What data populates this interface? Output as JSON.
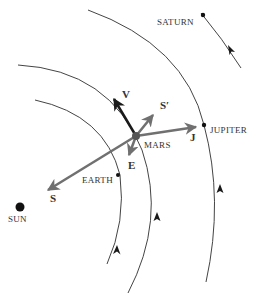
{
  "diagram": {
    "colors": {
      "orbit": "#444444",
      "vector_gray": "#707070",
      "vector_black": "#1a1a1a",
      "body": "#111111",
      "text": "#333333"
    },
    "bodies": [
      {
        "id": "sun",
        "label": "SUN"
      },
      {
        "id": "earth",
        "label": "EARTH"
      },
      {
        "id": "mars",
        "label": "MARS"
      },
      {
        "id": "jupiter",
        "label": "JUPITER"
      },
      {
        "id": "saturn",
        "label": "SATURN"
      }
    ],
    "vectors": [
      {
        "id": "v",
        "label": "V",
        "meaning": "velocity of Mars"
      },
      {
        "id": "s",
        "label": "S",
        "meaning": "force toward Sun"
      },
      {
        "id": "s_prime",
        "label": "S′",
        "meaning": "reaction/perturbation S'"
      },
      {
        "id": "e",
        "label": "E",
        "meaning": "force toward Earth"
      },
      {
        "id": "j",
        "label": "J",
        "meaning": "force toward Jupiter"
      }
    ],
    "orbits": [
      "Earth orbit",
      "Mars orbit",
      "Jupiter orbit",
      "Saturn orbit"
    ]
  }
}
